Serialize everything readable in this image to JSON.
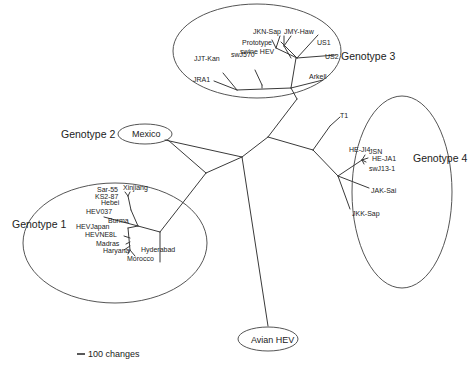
{
  "diagram": {
    "type": "unrooted phylogenetic tree",
    "genotypes": [
      {
        "label": "Genotype 1",
        "strains": [
          "Sar-55",
          "Xinjiang",
          "KS2-87",
          "Hebei",
          "HEV037",
          "Burma",
          "HEVJapan",
          "HEVNE8L",
          "Madras",
          "Haryana",
          "Morocco",
          "Hyderabad"
        ]
      },
      {
        "label": "Genotype 2",
        "strains": [
          "Mexico"
        ]
      },
      {
        "label": "Genotype 3",
        "strains": [
          "JKN-Sap",
          "JMY-Haw",
          "Prototype swine HEV",
          "US1",
          "US2",
          "JJT-Kan",
          "swJ570",
          "JRA1",
          "Arkell"
        ]
      },
      {
        "label": "Genotype 4",
        "strains": [
          "T1",
          "HE-JI4",
          "JSN",
          "HE-JA1",
          "swJ13-1",
          "JAK-Sai",
          "JKK-Sap"
        ]
      }
    ],
    "outgroup": "Avian HEV",
    "scale_bar": "100 changes"
  },
  "labels": {
    "g1": "Genotype 1",
    "g2": "Genotype 2",
    "g3": "Genotype 3",
    "g4": "Genotype 4",
    "mexico": "Mexico",
    "avian": "Avian HEV",
    "scale": "100 changes",
    "g1_leaves": {
      "sar55": "Sar-55",
      "xinjiang": "Xinjiang",
      "ks287": "KS2-87",
      "hebei": "Hebei",
      "hev037": "HEV037",
      "burma": "Burma",
      "hevjapan": "HEVJapan",
      "hevne8l": "HEVNE8L",
      "madras": "Madras",
      "haryana": "Haryana",
      "morocco": "Morocco",
      "hyderabad": "Hyderabad"
    },
    "g3_leaves": {
      "jknsap": "JKN-Sap",
      "jmyhaw": "JMY-Haw",
      "proto1": "Prototype",
      "proto2": "swine HEV",
      "us1": "US1",
      "us2": "US2",
      "jjtkan": "JJT-Kan",
      "swj570": "swJ570",
      "jra1": "JRA1",
      "arkell": "Arkell"
    },
    "g4_leaves": {
      "t1": "T1",
      "heji4": "HE-JI4",
      "jsn": "JSN",
      "heja1": "HE-JA1",
      "swj131": "swJ13-1",
      "jaksai": "JAK-Sai",
      "jkksap": "JKK-Sap"
    }
  }
}
